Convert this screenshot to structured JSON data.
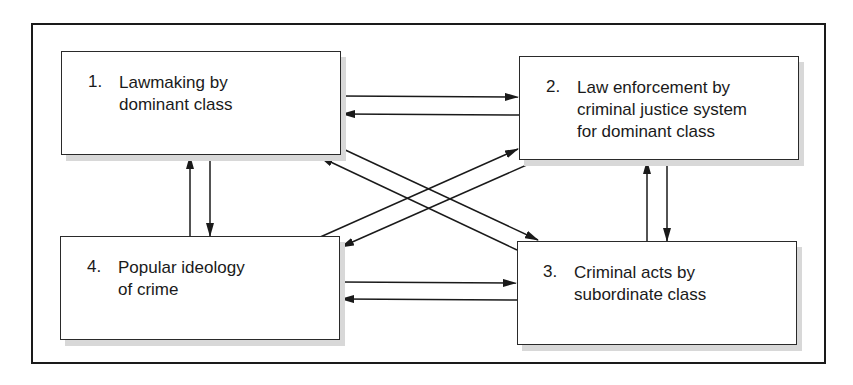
{
  "diagram": {
    "type": "flow",
    "nodes": [
      {
        "id": "1",
        "number": "1.",
        "label": "Lawmaking by\ndominant class"
      },
      {
        "id": "2",
        "number": "2.",
        "label": "Law enforcement by\ncriminal justice system\nfor dominant class"
      },
      {
        "id": "3",
        "number": "3.",
        "label": "Criminal acts by\nsubordinate class"
      },
      {
        "id": "4",
        "number": "4.",
        "label": "Popular ideology\nof crime"
      }
    ],
    "edges": [
      {
        "from": "1",
        "to": "2"
      },
      {
        "from": "2",
        "to": "1"
      },
      {
        "from": "1",
        "to": "4"
      },
      {
        "from": "4",
        "to": "1"
      },
      {
        "from": "2",
        "to": "3"
      },
      {
        "from": "3",
        "to": "2"
      },
      {
        "from": "4",
        "to": "3"
      },
      {
        "from": "3",
        "to": "4"
      },
      {
        "from": "1",
        "to": "3"
      },
      {
        "from": "3",
        "to": "1"
      },
      {
        "from": "4",
        "to": "2"
      },
      {
        "from": "2",
        "to": "4"
      }
    ],
    "colors": {
      "line": "#1a1a1a",
      "shadow": "#d8d8d8",
      "background": "#ffffff"
    }
  }
}
